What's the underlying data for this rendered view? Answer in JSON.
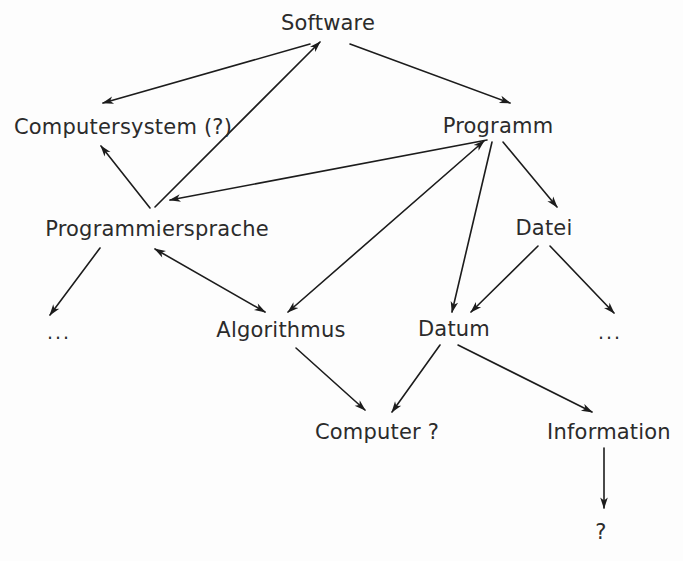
{
  "diagram": {
    "background_color": "#fdfdfd",
    "line_color": "#1c1c1c",
    "text_color": "#2b2b2b",
    "nodes": [
      {
        "id": "software",
        "label": "Software",
        "x": 328,
        "y": 23
      },
      {
        "id": "computersystem",
        "label": "Computersystem (?)",
        "x": 123,
        "y": 127
      },
      {
        "id": "programm",
        "label": "Programm",
        "x": 498,
        "y": 126
      },
      {
        "id": "programmiersprache",
        "label": "Programmiersprache",
        "x": 157,
        "y": 229
      },
      {
        "id": "datei",
        "label": "Datei",
        "x": 544,
        "y": 228
      },
      {
        "id": "ellipsis-left",
        "label": "...",
        "x": 59,
        "y": 332
      },
      {
        "id": "algorithmus",
        "label": "Algorithmus",
        "x": 281,
        "y": 330
      },
      {
        "id": "datum",
        "label": "Datum",
        "x": 454,
        "y": 329
      },
      {
        "id": "ellipsis-right",
        "label": "...",
        "x": 610,
        "y": 332
      },
      {
        "id": "computer",
        "label": "Computer ?",
        "x": 377,
        "y": 432
      },
      {
        "id": "information",
        "label": "Information",
        "x": 609,
        "y": 432
      },
      {
        "id": "question",
        "label": "?",
        "x": 601,
        "y": 532
      }
    ],
    "edges": [
      {
        "id": "software-computersystem",
        "from": "software",
        "to": "computersystem",
        "arrows": "end",
        "x1": 310,
        "y1": 44,
        "x2": 103,
        "y2": 103
      },
      {
        "id": "software-programm",
        "from": "software",
        "to": "programm",
        "arrows": "end",
        "x1": 350,
        "y1": 44,
        "x2": 510,
        "y2": 103
      },
      {
        "id": "programmiersprache-software",
        "from": "programmiersprache",
        "to": "software",
        "arrows": "end",
        "x1": 155,
        "y1": 207,
        "x2": 320,
        "y2": 42
      },
      {
        "id": "programmiersprache-computersystem",
        "from": "programmiersprache",
        "to": "computersystem",
        "arrows": "end",
        "x1": 150,
        "y1": 208,
        "x2": 101,
        "y2": 146
      },
      {
        "id": "programm-programmiersprache",
        "from": "programm",
        "to": "programmiersprache",
        "arrows": "end",
        "x1": 487,
        "y1": 140,
        "x2": 170,
        "y2": 200
      },
      {
        "id": "programmiersprache-ellipsis",
        "from": "programmiersprache",
        "to": "ellipsis-left",
        "arrows": "end",
        "x1": 100,
        "y1": 248,
        "x2": 50,
        "y2": 315
      },
      {
        "id": "programmiersprache-algorithmus",
        "from": "programmiersprache",
        "to": "algorithmus",
        "arrows": "both",
        "x1": 155,
        "y1": 249,
        "x2": 265,
        "y2": 312
      },
      {
        "id": "programm-algorithmus",
        "from": "programm",
        "to": "algorithmus",
        "arrows": "both",
        "x1": 484,
        "y1": 141,
        "x2": 288,
        "y2": 312
      },
      {
        "id": "programm-datei",
        "from": "programm",
        "to": "datei",
        "arrows": "end",
        "x1": 503,
        "y1": 142,
        "x2": 557,
        "y2": 207
      },
      {
        "id": "programm-datum",
        "from": "programm",
        "to": "datum",
        "arrows": "end",
        "x1": 492,
        "y1": 142,
        "x2": 452,
        "y2": 312
      },
      {
        "id": "datei-datum",
        "from": "datei",
        "to": "datum",
        "arrows": "end",
        "x1": 538,
        "y1": 246,
        "x2": 471,
        "y2": 312
      },
      {
        "id": "datei-ellipsis",
        "from": "datei",
        "to": "ellipsis-right",
        "arrows": "end",
        "x1": 550,
        "y1": 246,
        "x2": 614,
        "y2": 313
      },
      {
        "id": "algorithmus-computer",
        "from": "algorithmus",
        "to": "computer",
        "arrows": "end",
        "x1": 296,
        "y1": 348,
        "x2": 365,
        "y2": 410
      },
      {
        "id": "datum-computer",
        "from": "datum",
        "to": "computer",
        "arrows": "end",
        "x1": 440,
        "y1": 345,
        "x2": 392,
        "y2": 412
      },
      {
        "id": "datum-information",
        "from": "datum",
        "to": "information",
        "arrows": "end",
        "x1": 458,
        "y1": 345,
        "x2": 592,
        "y2": 412
      },
      {
        "id": "information-question",
        "from": "information",
        "to": "question",
        "arrows": "end",
        "x1": 604,
        "y1": 448,
        "x2": 604,
        "y2": 508
      }
    ]
  }
}
